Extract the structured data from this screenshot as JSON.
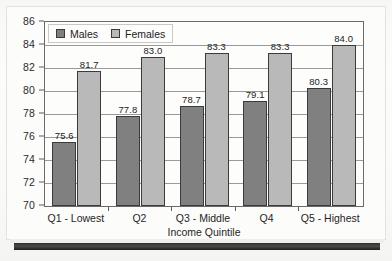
{
  "chart_data": {
    "type": "bar",
    "title": "",
    "xlabel": "Income Quintile",
    "ylabel": "",
    "categories": [
      "Q1 - Lowest",
      "Q2",
      "Q3 - Middle",
      "Q4",
      "Q5 - Highest"
    ],
    "series": [
      {
        "name": "Males",
        "color": "#808080",
        "values": [
          75.6,
          77.8,
          78.7,
          79.1,
          80.3
        ]
      },
      {
        "name": "Females",
        "color": "#b9b9b9",
        "values": [
          81.7,
          83.0,
          83.3,
          83.3,
          84.0
        ]
      }
    ],
    "value_labels": {
      "Males": [
        "75.6",
        "77.8",
        "78.7",
        "79.1",
        "80.3"
      ],
      "Females": [
        "81.7",
        "83.0",
        "83.3",
        "83.3",
        "84.0"
      ]
    },
    "ylim": [
      70,
      86
    ],
    "ytick_step": 2,
    "yticks": [
      "70",
      "72",
      "74",
      "76",
      "78",
      "80",
      "82",
      "84",
      "86"
    ],
    "grid": true,
    "legend_position": "top-left-inside"
  }
}
